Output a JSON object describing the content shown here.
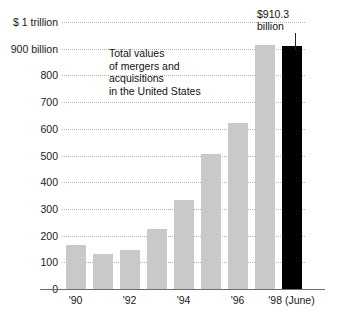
{
  "chart_data": {
    "type": "bar",
    "title": "",
    "annotation": "Total values\nof mergers and\nacquisitions\nin the United States",
    "callout": {
      "line1": "$910.3",
      "line2": "billion"
    },
    "xlabel": "",
    "ylabel": "",
    "ylim": [
      0,
      1000
    ],
    "grid": true,
    "legend": "none",
    "categories": [
      "1990",
      "1991",
      "1992",
      "1993",
      "1994",
      "1995",
      "1996",
      "1997",
      "1998"
    ],
    "values": [
      165,
      130,
      145,
      225,
      335,
      505,
      620,
      915,
      910.3
    ],
    "highlight_index": 8,
    "highlight_color": "#000000",
    "bar_color": "#c9c9c9",
    "ytick_labels": [
      "0",
      "100",
      "200",
      "300",
      "400",
      "500",
      "600",
      "700",
      "800",
      "900 billion",
      "$ 1 trillion"
    ],
    "ytick_values": [
      0,
      100,
      200,
      300,
      400,
      500,
      600,
      700,
      800,
      900,
      1000
    ],
    "xtick_labels": [
      "'90",
      "'92",
      "'94",
      "'96",
      "'98 (June)"
    ],
    "xtick_indices": [
      0,
      2,
      4,
      6,
      8
    ]
  }
}
